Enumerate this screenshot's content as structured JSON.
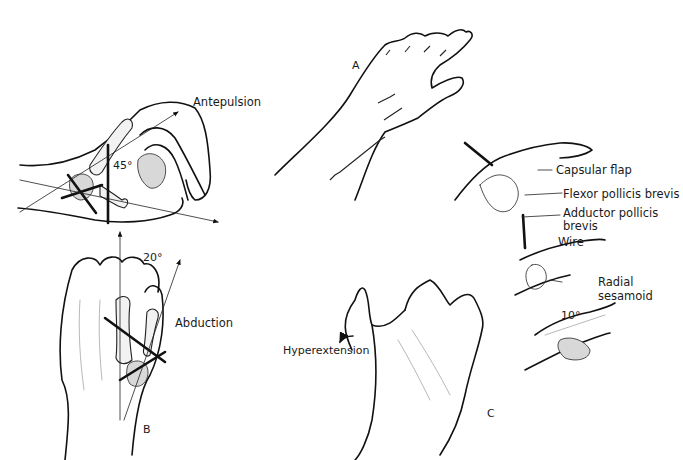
{
  "figure": {
    "panels": [
      {
        "id": "A",
        "label": "A",
        "description": "Dorsal hand and forearm with sutured incisions"
      },
      {
        "id": "B",
        "label": "B",
        "description": "Thumb axes: antepulsion and abduction"
      },
      {
        "id": "C",
        "label": "C",
        "description": "Hyperextension deformity and capsulodesis repair"
      }
    ],
    "labels": {
      "antepulsion": "Antepulsion",
      "angle_antepulsion": "45°",
      "angle_abduction": "20°",
      "abduction": "Abduction",
      "panel_a": "A",
      "panel_b": "B",
      "panel_c": "C",
      "hyperextension": "Hyperextension",
      "capsular_flap": "Capsular flap",
      "flexor_pollicis_brevis": "Flexor pollicis brevis",
      "adductor_pollicis_line1": "Adductor pollicis",
      "adductor_pollicis_line2": "brevis",
      "wire": "Wire",
      "radial_sesamoid_line1": "Radial",
      "radial_sesamoid_line2": "sesamoid",
      "angle_repair": "10°"
    }
  }
}
